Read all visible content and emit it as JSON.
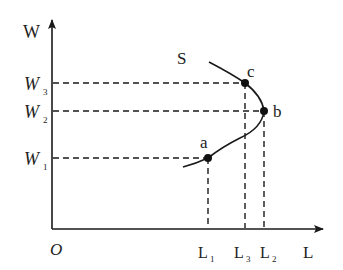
{
  "figure": {
    "type": "labor-supply-curve",
    "colors": {
      "ink": "#1a1a1a",
      "background": "#ffffff"
    },
    "axes": {
      "y_label": "W",
      "x_label": "L",
      "origin_label": "O"
    },
    "curve": {
      "label": "S"
    },
    "y_ticks": [
      {
        "main": "W",
        "sub": "3"
      },
      {
        "main": "W",
        "sub": "2"
      },
      {
        "main": "W",
        "sub": "1"
      }
    ],
    "x_ticks": [
      {
        "main": "L",
        "sub": "1"
      },
      {
        "main": "L",
        "sub": "3"
      },
      {
        "main": "L",
        "sub": "2"
      }
    ],
    "points": [
      {
        "label": "a",
        "wage": "W1",
        "labor": "L1"
      },
      {
        "label": "b",
        "wage": "W2",
        "labor": "L2"
      },
      {
        "label": "c",
        "wage": "W3",
        "labor": "L3"
      }
    ]
  }
}
